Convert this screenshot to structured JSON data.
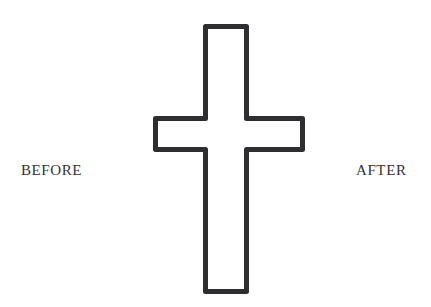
{
  "canvas": {
    "width": 431,
    "height": 307,
    "background_color": "#ffffff"
  },
  "labels": {
    "before": "Before",
    "after": "After",
    "text_color": "#333335"
  },
  "figure": {
    "name": "latin-cross-outline",
    "stroke_color": "#2e2e30",
    "fill_color": "#ffffff",
    "stroke_width": 5,
    "geometry": {
      "shaft_left": 203,
      "shaft_right": 249,
      "shaft_top": 24,
      "shaft_bottom": 294,
      "arm_left": 153,
      "arm_right": 305,
      "arm_top": 116,
      "arm_bottom": 152
    }
  }
}
